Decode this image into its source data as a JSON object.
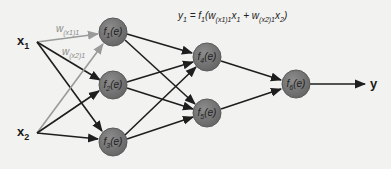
{
  "diagram": {
    "type": "feedforward-neural-network",
    "colors": {
      "background": "#f2f2f0",
      "node_fill": "#7a7a7a",
      "node_stroke": "#5a5a5a",
      "edge": "#1e1e1e",
      "highlight_edge": "#9a9a9a"
    },
    "formula": {
      "lhs": "y",
      "lhs_sub": "1",
      "eq": " = f",
      "f_sub": "1",
      "open": "(w",
      "w1_sub": "(x1)1",
      "x1": "x",
      "x1_sub": "1",
      "plus": " + w",
      "w2_sub": "(x2)1",
      "x2": "x",
      "x2_sub": "2",
      "close": ")"
    },
    "inputs": [
      {
        "id": "x1",
        "label": "x",
        "sub": "1"
      },
      {
        "id": "x2",
        "label": "x",
        "sub": "2"
      }
    ],
    "weights": [
      {
        "label": "w",
        "sub": "(x1)1"
      },
      {
        "label": "w",
        "sub": "(x2)1"
      }
    ],
    "nodes": [
      {
        "id": "f1",
        "label": "f",
        "sub": "1",
        "arg": "(e)",
        "layer": 1
      },
      {
        "id": "f2",
        "label": "f",
        "sub": "2",
        "arg": "(e)",
        "layer": 1
      },
      {
        "id": "f3",
        "label": "f",
        "sub": "3",
        "arg": "(e)",
        "layer": 1
      },
      {
        "id": "f4",
        "label": "f",
        "sub": "4",
        "arg": "(e)",
        "layer": 2
      },
      {
        "id": "f5",
        "label": "f",
        "sub": "5",
        "arg": "(e)",
        "layer": 2
      },
      {
        "id": "f6",
        "label": "f",
        "sub": "6",
        "arg": "(e)",
        "layer": 3
      }
    ],
    "output": {
      "label": "y"
    },
    "edges": [
      [
        "x1",
        "f1"
      ],
      [
        "x1",
        "f2"
      ],
      [
        "x1",
        "f3"
      ],
      [
        "x2",
        "f1"
      ],
      [
        "x2",
        "f2"
      ],
      [
        "x2",
        "f3"
      ],
      [
        "f1",
        "f4"
      ],
      [
        "f1",
        "f5"
      ],
      [
        "f2",
        "f4"
      ],
      [
        "f2",
        "f5"
      ],
      [
        "f3",
        "f4"
      ],
      [
        "f3",
        "f5"
      ],
      [
        "f4",
        "f6"
      ],
      [
        "f5",
        "f6"
      ],
      [
        "f6",
        "y"
      ]
    ]
  }
}
